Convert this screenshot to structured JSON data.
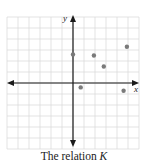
{
  "chart_data": {
    "type": "scatter",
    "title": "",
    "caption_text": "The relation ",
    "caption_var": "K",
    "xlabel": "x",
    "ylabel": "y",
    "grid": true,
    "xlim": [
      -6,
      6
    ],
    "ylim": [
      -6,
      6
    ],
    "axis_arrows": true,
    "points": [
      {
        "x": 0,
        "y": 2.6
      },
      {
        "x": 1.9,
        "y": 2.5
      },
      {
        "x": 2.8,
        "y": 1.5
      },
      {
        "x": 4.9,
        "y": 3.3
      },
      {
        "x": 0.7,
        "y": -0.4
      },
      {
        "x": 4.6,
        "y": -0.7
      }
    ],
    "colors": {
      "grid": "#dcdcdc",
      "axis": "#1a1a1a",
      "point": "#7a7a7a"
    }
  }
}
